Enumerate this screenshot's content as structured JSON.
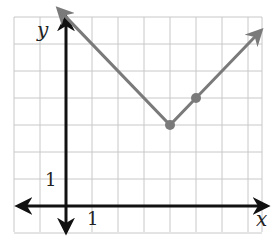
{
  "chart_data": {
    "type": "line",
    "title": "",
    "xlabel": "x",
    "ylabel": "y",
    "function": "y = |x - 4| + 3",
    "xlim": [
      -2,
      8
    ],
    "ylim": [
      -1,
      7
    ],
    "grid": true,
    "tick_labels": {
      "x": [
        "1"
      ],
      "y": [
        "1"
      ]
    },
    "series": [
      {
        "name": "absolute value graph",
        "x": [
          -0.3,
          4,
          5,
          7.5
        ],
        "y": [
          7.3,
          3,
          4,
          6.5
        ],
        "arrows": "both ends"
      }
    ],
    "points": [
      {
        "label": "vertex",
        "x": 4,
        "y": 3
      },
      {
        "label": "point",
        "x": 5,
        "y": 4
      }
    ],
    "colors": {
      "curve": "#7a7a7a",
      "axes": "#111111",
      "grid": "#c8c8c8"
    }
  }
}
